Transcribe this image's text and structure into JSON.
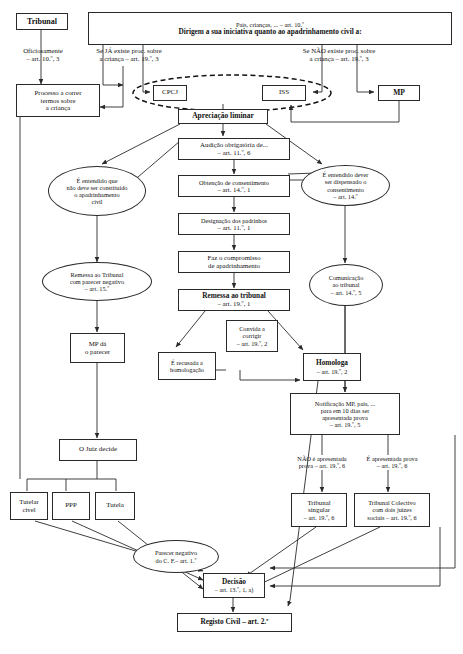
{
  "diagram": {
    "colors": {
      "stroke": "#2a2a2a",
      "text": "#111111",
      "background": "#ffffff"
    },
    "nodes": {
      "tribunal_top": {
        "label": "Tribunal",
        "shape": "box",
        "bold": true
      },
      "header_banner": {
        "line1": "Pais, crianças, ... – art. 10.º",
        "line2": "Dirigem a sua iniciativa quanto ao apadrinhamento civil a:",
        "shape": "box"
      },
      "oficiosamente": {
        "line1": "Oficiosamente",
        "line2": "– art. 10.º, 3",
        "shape": "label"
      },
      "se_ja_existe": {
        "line1": "Se JÁ existe proc. sobre",
        "line2": "a criança – art. 19.º, 3",
        "shape": "label"
      },
      "se_nao_existe": {
        "line1": "Se NÃO existe proc. sobre",
        "line2": "a criança – art. 19.º, 3",
        "shape": "label"
      },
      "processo_correr": {
        "line1": "Processo a correr",
        "line2": "termos sobre",
        "line3": "a criança",
        "shape": "box"
      },
      "cpcj": {
        "label": "CPCJ",
        "shape": "box"
      },
      "iss": {
        "label": "ISS",
        "shape": "box"
      },
      "mp_top": {
        "label": "MP",
        "shape": "box",
        "bold": true
      },
      "apreciacao_liminar": {
        "label": "Apreciação liminar",
        "shape": "box",
        "bold": true
      },
      "audicao": {
        "line1": "Audição obrigatória de...",
        "line2": "– art. 11.º, 6",
        "shape": "box"
      },
      "obtencao": {
        "line1": "Obtenção de consentimento",
        "line2": "– art. 14.º, 1",
        "shape": "box"
      },
      "designacao": {
        "line1": "Designação dos padrinhos",
        "line2": "– art. 11.º, 1",
        "shape": "box"
      },
      "compromisso": {
        "line1": "Faz o compromisso",
        "line2": "de apadrinhamento",
        "shape": "box"
      },
      "remessa_tribunal": {
        "line1": "Remessa ao tribunal",
        "line2": "– art. 19.º, 1",
        "shape": "box",
        "bold": true
      },
      "entendido_nao_constituido": {
        "line1": "É entendido que",
        "line2": "não deve ser constituído",
        "line3": "o apadrinhamento",
        "line4": "civil",
        "shape": "ellipse"
      },
      "remessa_parecer_negativo": {
        "line1": "Remessa ao Tribunal",
        "line2": "com parecer negativo",
        "line3": "– art. 15.º",
        "shape": "ellipse"
      },
      "mp_da_parecer": {
        "line1": "MP dá",
        "line2": "o parecer",
        "shape": "box"
      },
      "juiz_decide": {
        "label": "O Juiz decide",
        "shape": "box"
      },
      "entendido_dispensado": {
        "line1": "É entendido dever",
        "line2": "ser dispensado o",
        "line3": "consentimento",
        "line4": "– art. 14.º",
        "shape": "ellipse"
      },
      "comunicacao_tribunal": {
        "line1": "Comunicação",
        "line2": "ao tribunal",
        "line3": "– art. 14.º, 5",
        "shape": "ellipse"
      },
      "convida_corrigir": {
        "line1": "Convida a",
        "line2": "corrigir",
        "line3": "– art. 19.º, 2",
        "shape": "box"
      },
      "recusada_homologacao": {
        "line1": "É recusada a",
        "line2": "homologação",
        "shape": "box"
      },
      "homologa": {
        "line1": "Homologa",
        "line2": "– art. 19.º, 2",
        "shape": "box",
        "bold": true
      },
      "notificacao_mp": {
        "line1": "Notificação MP, pais, ...",
        "line2": "para em 10 dias ser",
        "line3": "apresentada prova",
        "line4": "– art. 19.º, 5",
        "shape": "box"
      },
      "nao_apresentada": {
        "line1": "NÃO é apresentada",
        "line2": "prova – art. 19.º, 6",
        "shape": "label"
      },
      "e_apresentada": {
        "line1": "É apresentada prova",
        "line2": "– art. 19.º, 6",
        "shape": "label"
      },
      "tribunal_singular": {
        "line1": "Tribunal",
        "line2": "singular",
        "line3": "– art. 19.º, 6",
        "shape": "box"
      },
      "tribunal_colectivo": {
        "line1": "Tribunal Colectivo",
        "line2": "com dois juízes",
        "line3": "sociais – art. 19.º, 6",
        "shape": "box"
      },
      "tutelar_civel": {
        "line1": "Tutelar",
        "line2": "cível",
        "shape": "box"
      },
      "ppp": {
        "label": "PPP",
        "shape": "box"
      },
      "tutela": {
        "label": "Tutela",
        "shape": "box"
      },
      "parecer_negativo_cf": {
        "line1": "Parecer negativo",
        "line2": "do C. F.– art. 1.º",
        "shape": "ellipse"
      },
      "decisao": {
        "line1": "Decisão",
        "line2": "– art. 13.º, 1, a)",
        "shape": "box",
        "bold": true
      },
      "registo_civil": {
        "label": "Registo Civil – art. 2.º",
        "shape": "box",
        "bold": true
      }
    },
    "grouping": {
      "dashed_ellipse_note": "CPCJ e ISS agrupados por elipse tracejada"
    }
  }
}
